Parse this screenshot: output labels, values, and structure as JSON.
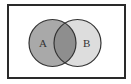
{
  "diagram": {
    "type": "venn",
    "universe": {
      "x": 8,
      "y": 5,
      "width": 117,
      "height": 73,
      "fill": "#ffffff",
      "stroke": "#2a2a2a"
    },
    "sets": [
      {
        "label": "A",
        "cx": 52.5,
        "cy": 43,
        "r": 23.5,
        "fill": "#a9a9a9",
        "stroke": "#333333",
        "label_x": 42,
        "label_y": 47
      },
      {
        "label": "B",
        "cx": 77.5,
        "cy": 43,
        "r": 23.5,
        "fill": "#dddddd",
        "stroke": "#333333",
        "label_x": 86,
        "label_y": 47
      }
    ],
    "intersection_fill": "#8e8e8e"
  },
  "labels": {
    "set_a": "A",
    "set_b": "B"
  }
}
